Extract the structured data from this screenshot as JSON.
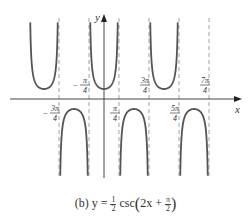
{
  "chart_data": {
    "type": "line",
    "function": "y = 0.5 * csc(2x + pi/2)",
    "xlabel": "x",
    "ylabel": "y",
    "asymptotes": [
      "-3π/4",
      "-π/4",
      "π/4",
      "3π/4",
      "5π/4",
      "7π/4"
    ],
    "asymptote_values": [
      -2.356,
      -0.785,
      0.785,
      2.356,
      3.927,
      5.498
    ],
    "tick_labels_above_axis": [
      "-π/4",
      "3π/4",
      "7π/4"
    ],
    "tick_labels_below_axis": [
      "-3π/4",
      "π/4",
      "5π/4"
    ],
    "branches": [
      {
        "direction": "up",
        "vertex_x": "-π",
        "vertex_y": 0.5
      },
      {
        "direction": "down",
        "vertex_x": "-π/2",
        "vertex_y": -0.5
      },
      {
        "direction": "up",
        "vertex_x": "0",
        "vertex_y": 0.5
      },
      {
        "direction": "down",
        "vertex_x": "π/2",
        "vertex_y": -0.5
      },
      {
        "direction": "up",
        "vertex_x": "π",
        "vertex_y": 0.5
      },
      {
        "direction": "down",
        "vertex_x": "3π/2",
        "vertex_y": -0.5
      }
    ],
    "grid": false,
    "legend": null
  },
  "labels": {
    "y_axis": "y",
    "x_axis": "x",
    "neg_pi_4": {
      "sign": "−",
      "num": "π",
      "den": "4"
    },
    "three_pi_4": {
      "sign": "",
      "num": "3π",
      "den": "4"
    },
    "seven_pi_4": {
      "sign": "",
      "num": "7π",
      "den": "4"
    },
    "neg_three_pi_4": {
      "sign": "−",
      "num": "3π",
      "den": "4"
    },
    "pi_4": {
      "sign": "",
      "num": "π",
      "den": "4"
    },
    "five_pi_4": {
      "sign": "",
      "num": "5π",
      "den": "4"
    }
  },
  "caption": {
    "prefix": "(b) y = ",
    "coef_num": "1",
    "coef_den": "2",
    "func": " csc",
    "open": "(",
    "arg": "2x + ",
    "shift_num": "π",
    "shift_den": "2",
    "close": ")"
  },
  "colors": {
    "curve": "#555555",
    "axis": "#333333",
    "asymptote": "#999999"
  }
}
